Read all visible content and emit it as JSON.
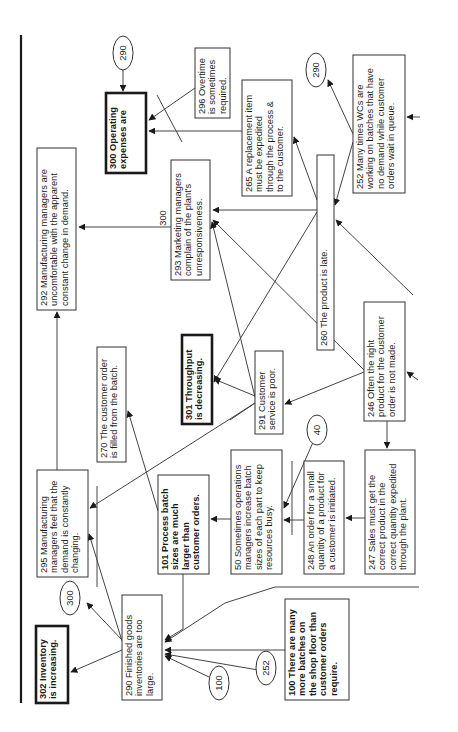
{
  "diagram": {
    "orientation": "rotated -90deg",
    "nodes": [
      {
        "id": "300",
        "lines": [
          "300 Operating",
          "expenses are"
        ],
        "bold": true,
        "thick": true
      },
      {
        "id": "296",
        "lines": [
          "296 Overtime",
          "is sometimes",
          "required."
        ]
      },
      {
        "id": "292",
        "lines": [
          "292 Manufacturing managers are",
          "uncomfortable with the apparent",
          "constant change in demand."
        ]
      },
      {
        "id": "293",
        "lines": [
          "293 Marketing managers",
          "complain of the plant's",
          "unresponsiveness."
        ]
      },
      {
        "id": "265",
        "lines": [
          "265 A replacement item",
          "must be expedited",
          "through the process &",
          "to the customer."
        ]
      },
      {
        "id": "260",
        "lines": [
          "260 The product is late."
        ]
      },
      {
        "id": "252",
        "lines": [
          "252 Many times WCs are",
          "working on batches that have",
          "no demand while customer",
          "orders wait in queue."
        ]
      },
      {
        "id": "270",
        "lines": [
          "270 The customer order",
          "is filled from the batch."
        ]
      },
      {
        "id": "301",
        "lines": [
          "301 Throughput",
          "is decreasing."
        ],
        "bold": true,
        "thick": true
      },
      {
        "id": "291",
        "lines": [
          "291  Customer",
          "service is poor."
        ]
      },
      {
        "id": "246",
        "lines": [
          "246 Often the right",
          "product for the customer",
          "order is not made."
        ]
      },
      {
        "id": "295",
        "lines": [
          "295 Manufacturing",
          "managers feel that the",
          "demand is constantly",
          "changing."
        ]
      },
      {
        "id": "101",
        "lines": [
          "101 Process batch",
          "sizes are much",
          "larger than",
          "customer orders."
        ],
        "bold": true
      },
      {
        "id": "50",
        "lines": [
          "50 Sometimes operations",
          "managers increase batch",
          "sizes of each part to keep",
          "resources busy."
        ]
      },
      {
        "id": "248",
        "lines": [
          "248 An order for a small",
          "quantity of a product for",
          "a customer is initiated."
        ]
      },
      {
        "id": "247",
        "lines": [
          "247 Sales must get the",
          "correct product in the",
          "correct quantity expedited",
          "through the plant."
        ]
      },
      {
        "id": "290",
        "lines": [
          "290 Finished goods",
          "inventories are  too",
          "large."
        ]
      },
      {
        "id": "302",
        "lines": [
          "302 Inventory",
          "is increasing."
        ],
        "bold": true,
        "thick": true
      },
      {
        "id": "100",
        "lines": [
          "100 There are many",
          "more batches on",
          "the shop floor than",
          "customer orders",
          "require."
        ],
        "bold": true
      }
    ],
    "connectors": [
      {
        "id": "c290a",
        "label": "290"
      },
      {
        "id": "c290b",
        "label": "290"
      },
      {
        "id": "c300a",
        "label": "300"
      },
      {
        "id": "c40",
        "label": "40"
      },
      {
        "id": "c100",
        "label": "100"
      },
      {
        "id": "c252",
        "label": "252"
      }
    ],
    "free_labels": [
      {
        "id": "l300",
        "text": "300"
      }
    ]
  }
}
